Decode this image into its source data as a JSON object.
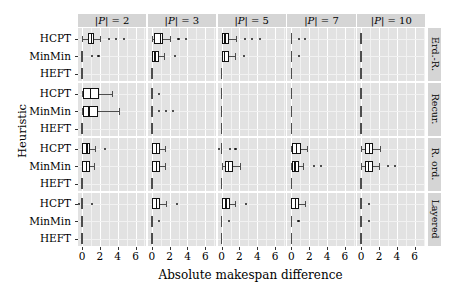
{
  "figure": {
    "x_axis_label": "Absolute makespan difference",
    "y_axis_label": "Heuristic",
    "x_ticks": [
      "0",
      "2",
      "4",
      "6"
    ],
    "x_tick_values": [
      0,
      2,
      4,
      6
    ],
    "x_range": [
      -0.45,
      7.2
    ],
    "heuristics": [
      "HCPT",
      "MinMin",
      "HEFT"
    ],
    "column_strips": [
      "|P| = 2",
      "|P| = 3",
      "|P| = 5",
      "|P| = 7",
      "|P| = 10"
    ],
    "row_strips": [
      "Erd.-R.",
      "Recur.",
      "R. ord.",
      "Layered"
    ],
    "colors": {
      "panel_background": "#e2e2e2",
      "strip_background": "#d5d5d5",
      "major_gridline": "#ffffff",
      "minor_gridline": "#f2f2f2",
      "box_outline": "#111111",
      "box_fill": "#ffffff",
      "whisker": "#4d4d4d",
      "outlier": "#1a1a1a"
    }
  },
  "chart_data": {
    "type": "box",
    "title": "",
    "xlabel": "Absolute makespan difference",
    "ylabel": "Heuristic",
    "xlim": [
      -0.45,
      7.2
    ],
    "x_ticks": [
      0,
      2,
      4,
      6
    ],
    "grid": true,
    "legend": "none",
    "facet_cols": [
      "|P| = 2",
      "|P| = 3",
      "|P| = 5",
      "|P| = 7",
      "|P| = 10"
    ],
    "facet_rows": [
      "Erd.-R.",
      "Recur.",
      "R. ord.",
      "Layered"
    ],
    "y_categories": [
      "HCPT",
      "MinMin",
      "HEFT"
    ],
    "panels": [
      {
        "row": "Erd.-R.",
        "col": "|P| = 2",
        "boxes": [
          {
            "heuristic": "HCPT",
            "whisker_low": 0.0,
            "q1": 0.72,
            "median": 1.05,
            "q3": 1.35,
            "whisker_high": 2.0,
            "outliers": [
              3.0,
              3.85,
              4.7
            ]
          },
          {
            "heuristic": "MinMin",
            "whisker_low": 0.0,
            "q1": 0.0,
            "median": 0.0,
            "q3": 0.0,
            "whisker_high": 0.0,
            "outliers": [
              1.1,
              1.85
            ]
          },
          {
            "heuristic": "HEFT",
            "whisker_low": 0.0,
            "q1": 0.0,
            "median": 0.0,
            "q3": 0.0,
            "whisker_high": 0.0,
            "outliers": []
          }
        ]
      },
      {
        "row": "Erd.-R.",
        "col": "|P| = 3",
        "boxes": [
          {
            "heuristic": "HCPT",
            "whisker_low": 0.0,
            "q1": 0.25,
            "median": 0.95,
            "q3": 1.3,
            "whisker_high": 2.0,
            "outliers": [
              3.0,
              3.8
            ]
          },
          {
            "heuristic": "MinMin",
            "whisker_low": 0.0,
            "q1": 0.0,
            "median": 0.35,
            "q3": 0.8,
            "whisker_high": 1.4,
            "outliers": [
              2.6
            ]
          },
          {
            "heuristic": "HEFT",
            "whisker_low": 0.0,
            "q1": 0.0,
            "median": 0.0,
            "q3": 0.0,
            "whisker_high": 0.0,
            "outliers": []
          }
        ]
      },
      {
        "row": "Erd.-R.",
        "col": "|P| = 5",
        "boxes": [
          {
            "heuristic": "HCPT",
            "whisker_low": 0.0,
            "q1": 0.0,
            "median": 0.4,
            "q3": 0.85,
            "whisker_high": 1.6,
            "outliers": [
              2.6,
              3.4,
              4.3
            ]
          },
          {
            "heuristic": "MinMin",
            "whisker_low": 0.0,
            "q1": 0.0,
            "median": 0.35,
            "q3": 0.8,
            "whisker_high": 1.45,
            "outliers": [
              2.5
            ]
          },
          {
            "heuristic": "HEFT",
            "whisker_low": 0.0,
            "q1": 0.0,
            "median": 0.0,
            "q3": 0.0,
            "whisker_high": 0.0,
            "outliers": []
          }
        ]
      },
      {
        "row": "Erd.-R.",
        "col": "|P| = 7",
        "boxes": [
          {
            "heuristic": "HCPT",
            "whisker_low": 0.0,
            "q1": 0.0,
            "median": 0.0,
            "q3": 0.0,
            "whisker_high": 0.0,
            "outliers": [
              0.85,
              1.55
            ]
          },
          {
            "heuristic": "MinMin",
            "whisker_low": 0.0,
            "q1": 0.0,
            "median": 0.0,
            "q3": 0.0,
            "whisker_high": 0.0,
            "outliers": [
              0.85
            ]
          },
          {
            "heuristic": "HEFT",
            "whisker_low": 0.0,
            "q1": 0.0,
            "median": 0.0,
            "q3": 0.0,
            "whisker_high": 0.0,
            "outliers": []
          }
        ]
      },
      {
        "row": "Erd.-R.",
        "col": "|P| = 10",
        "boxes": [
          {
            "heuristic": "HCPT",
            "whisker_low": 0.0,
            "q1": 0.0,
            "median": 0.0,
            "q3": 0.0,
            "whisker_high": 0.0,
            "outliers": []
          },
          {
            "heuristic": "MinMin",
            "whisker_low": 0.0,
            "q1": 0.0,
            "median": 0.0,
            "q3": 0.0,
            "whisker_high": 0.0,
            "outliers": []
          },
          {
            "heuristic": "HEFT",
            "whisker_low": 0.0,
            "q1": 0.0,
            "median": 0.0,
            "q3": 0.0,
            "whisker_high": 0.0,
            "outliers": []
          }
        ]
      },
      {
        "row": "Recur.",
        "col": "|P| = 2",
        "boxes": [
          {
            "heuristic": "HCPT",
            "whisker_low": 0.0,
            "q1": 0.1,
            "median": 0.95,
            "q3": 1.95,
            "whisker_high": 3.4,
            "outliers": []
          },
          {
            "heuristic": "MinMin",
            "whisker_low": 0.0,
            "q1": 0.1,
            "median": 0.8,
            "q3": 1.85,
            "whisker_high": 4.1,
            "outliers": []
          },
          {
            "heuristic": "HEFT",
            "whisker_low": 0.0,
            "q1": 0.0,
            "median": 0.0,
            "q3": 0.0,
            "whisker_high": 0.0,
            "outliers": []
          }
        ]
      },
      {
        "row": "Recur.",
        "col": "|P| = 3",
        "boxes": [
          {
            "heuristic": "HCPT",
            "whisker_low": 0.0,
            "q1": 0.0,
            "median": 0.0,
            "q3": 0.0,
            "whisker_high": 0.0,
            "outliers": [
              0.85
            ]
          },
          {
            "heuristic": "MinMin",
            "whisker_low": 0.0,
            "q1": 0.0,
            "median": 0.0,
            "q3": 0.0,
            "whisker_high": 0.0,
            "outliers": [
              0.85,
              1.6,
              2.35
            ]
          },
          {
            "heuristic": "HEFT",
            "whisker_low": 0.0,
            "q1": 0.0,
            "median": 0.0,
            "q3": 0.0,
            "whisker_high": 0.0,
            "outliers": []
          }
        ]
      },
      {
        "row": "Recur.",
        "col": "|P| = 5",
        "boxes": [
          {
            "heuristic": "HCPT",
            "whisker_low": 0.0,
            "q1": 0.0,
            "median": 0.0,
            "q3": 0.0,
            "whisker_high": 0.0,
            "outliers": []
          },
          {
            "heuristic": "MinMin",
            "whisker_low": 0.0,
            "q1": 0.0,
            "median": 0.0,
            "q3": 0.0,
            "whisker_high": 0.0,
            "outliers": []
          },
          {
            "heuristic": "HEFT",
            "whisker_low": 0.0,
            "q1": 0.0,
            "median": 0.0,
            "q3": 0.0,
            "whisker_high": 0.0,
            "outliers": []
          }
        ]
      },
      {
        "row": "Recur.",
        "col": "|P| = 7",
        "boxes": [
          {
            "heuristic": "HCPT",
            "whisker_low": 0.0,
            "q1": 0.0,
            "median": 0.0,
            "q3": 0.0,
            "whisker_high": 0.0,
            "outliers": []
          },
          {
            "heuristic": "MinMin",
            "whisker_low": 0.0,
            "q1": 0.0,
            "median": 0.0,
            "q3": 0.0,
            "whisker_high": 0.0,
            "outliers": []
          },
          {
            "heuristic": "HEFT",
            "whisker_low": 0.0,
            "q1": 0.0,
            "median": 0.0,
            "q3": 0.0,
            "whisker_high": 0.0,
            "outliers": []
          }
        ]
      },
      {
        "row": "Recur.",
        "col": "|P| = 10",
        "boxes": [
          {
            "heuristic": "HCPT",
            "whisker_low": 0.0,
            "q1": 0.0,
            "median": 0.0,
            "q3": 0.0,
            "whisker_high": 0.0,
            "outliers": []
          },
          {
            "heuristic": "MinMin",
            "whisker_low": 0.0,
            "q1": 0.0,
            "median": 0.0,
            "q3": 0.0,
            "whisker_high": 0.0,
            "outliers": []
          },
          {
            "heuristic": "HEFT",
            "whisker_low": 0.0,
            "q1": 0.0,
            "median": 0.0,
            "q3": 0.0,
            "whisker_high": 0.0,
            "outliers": []
          }
        ]
      },
      {
        "row": "R. ord.",
        "col": "|P| = 2",
        "boxes": [
          {
            "heuristic": "HCPT",
            "whisker_low": 0.0,
            "q1": 0.05,
            "median": 0.55,
            "q3": 0.95,
            "whisker_high": 1.45,
            "outliers": [
              2.6
            ]
          },
          {
            "heuristic": "MinMin",
            "whisker_low": 0.0,
            "q1": 0.05,
            "median": 0.5,
            "q3": 0.9,
            "whisker_high": 1.4,
            "outliers": []
          },
          {
            "heuristic": "HEFT",
            "whisker_low": 0.0,
            "q1": 0.0,
            "median": 0.0,
            "q3": 0.0,
            "whisker_high": 0.0,
            "outliers": []
          }
        ]
      },
      {
        "row": "R. ord.",
        "col": "|P| = 3",
        "boxes": [
          {
            "heuristic": "HCPT",
            "whisker_low": 0.0,
            "q1": 0.0,
            "median": 0.5,
            "q3": 0.95,
            "whisker_high": 1.5,
            "outliers": []
          },
          {
            "heuristic": "MinMin",
            "whisker_low": 0.0,
            "q1": 0.0,
            "median": 0.5,
            "q3": 0.95,
            "whisker_high": 1.5,
            "outliers": []
          },
          {
            "heuristic": "HEFT",
            "whisker_low": 0.0,
            "q1": 0.0,
            "median": 0.0,
            "q3": 0.0,
            "whisker_high": 0.0,
            "outliers": []
          }
        ]
      },
      {
        "row": "R. ord.",
        "col": "|P| = 5",
        "boxes": [
          {
            "heuristic": "HCPT",
            "whisker_low": 0.0,
            "q1": 0.0,
            "median": 0.0,
            "q3": 0.0,
            "whisker_high": 0.0,
            "outliers": [
              -0.25,
              0.9,
              1.55
            ]
          },
          {
            "heuristic": "MinMin",
            "whisker_low": 0.0,
            "q1": 0.35,
            "median": 0.8,
            "q3": 1.25,
            "whisker_high": 2.1,
            "outliers": []
          },
          {
            "heuristic": "HEFT",
            "whisker_low": 0.0,
            "q1": 0.0,
            "median": 0.0,
            "q3": 0.0,
            "whisker_high": 0.0,
            "outliers": []
          }
        ]
      },
      {
        "row": "R. ord.",
        "col": "|P| = 7",
        "boxes": [
          {
            "heuristic": "HCPT",
            "whisker_low": 0.0,
            "q1": 0.1,
            "median": 0.6,
            "q3": 1.05,
            "whisker_high": 1.75,
            "outliers": []
          },
          {
            "heuristic": "MinMin",
            "whisker_low": 0.0,
            "q1": 0.05,
            "median": 0.4,
            "q3": 0.8,
            "whisker_high": 1.35,
            "outliers": [
              2.55,
              3.3
            ]
          },
          {
            "heuristic": "HEFT",
            "whisker_low": 0.0,
            "q1": 0.0,
            "median": 0.0,
            "q3": 0.0,
            "whisker_high": 0.0,
            "outliers": []
          }
        ]
      },
      {
        "row": "R. ord.",
        "col": "|P| = 10",
        "boxes": [
          {
            "heuristic": "HCPT",
            "whisker_low": 0.0,
            "q1": 0.45,
            "median": 0.9,
            "q3": 1.35,
            "whisker_high": 2.1,
            "outliers": []
          },
          {
            "heuristic": "MinMin",
            "whisker_low": 0.0,
            "q1": 0.45,
            "median": 0.85,
            "q3": 1.3,
            "whisker_high": 2.0,
            "outliers": [
              3.0,
              3.75
            ]
          },
          {
            "heuristic": "HEFT",
            "whisker_low": 0.0,
            "q1": 0.0,
            "median": 0.0,
            "q3": 0.0,
            "whisker_high": 0.0,
            "outliers": []
          }
        ]
      },
      {
        "row": "Layered",
        "col": "|P| = 2",
        "boxes": [
          {
            "heuristic": "HCPT",
            "whisker_low": 0.0,
            "q1": 0.0,
            "median": 0.0,
            "q3": 0.0,
            "whisker_high": 0.0,
            "outliers": [
              -0.3,
              1.1
            ]
          },
          {
            "heuristic": "MinMin",
            "whisker_low": 0.0,
            "q1": 0.0,
            "median": 0.0,
            "q3": 0.0,
            "whisker_high": 0.0,
            "outliers": []
          },
          {
            "heuristic": "HEFT",
            "whisker_low": 0.0,
            "q1": 0.0,
            "median": 0.0,
            "q3": 0.0,
            "whisker_high": 0.0,
            "outliers": []
          }
        ]
      },
      {
        "row": "Layered",
        "col": "|P| = 3",
        "boxes": [
          {
            "heuristic": "HCPT",
            "whisker_low": 0.0,
            "q1": 0.0,
            "median": 0.5,
            "q3": 0.95,
            "whisker_high": 1.6,
            "outliers": [
              2.8
            ]
          },
          {
            "heuristic": "MinMin",
            "whisker_low": 0.0,
            "q1": 0.0,
            "median": 0.0,
            "q3": 0.0,
            "whisker_high": 0.0,
            "outliers": [
              0.85
            ]
          },
          {
            "heuristic": "HEFT",
            "whisker_low": 0.0,
            "q1": 0.0,
            "median": 0.0,
            "q3": 0.0,
            "whisker_high": 0.0,
            "outliers": []
          }
        ]
      },
      {
        "row": "Layered",
        "col": "|P| = 5",
        "boxes": [
          {
            "heuristic": "HCPT",
            "whisker_low": 0.0,
            "q1": 0.0,
            "median": 0.5,
            "q3": 0.95,
            "whisker_high": 1.55,
            "outliers": [
              2.7
            ]
          },
          {
            "heuristic": "MinMin",
            "whisker_low": 0.0,
            "q1": 0.0,
            "median": 0.0,
            "q3": 0.0,
            "whisker_high": 0.0,
            "outliers": [
              0.85
            ]
          },
          {
            "heuristic": "HEFT",
            "whisker_low": 0.0,
            "q1": 0.0,
            "median": 0.0,
            "q3": 0.0,
            "whisker_high": 0.0,
            "outliers": []
          }
        ]
      },
      {
        "row": "Layered",
        "col": "|P| = 7",
        "boxes": [
          {
            "heuristic": "HCPT",
            "whisker_low": 0.0,
            "q1": 0.0,
            "median": 0.45,
            "q3": 0.9,
            "whisker_high": 1.5,
            "outliers": []
          },
          {
            "heuristic": "MinMin",
            "whisker_low": 0.0,
            "q1": 0.0,
            "median": 0.0,
            "q3": 0.0,
            "whisker_high": 0.0,
            "outliers": [
              0.8
            ]
          },
          {
            "heuristic": "HEFT",
            "whisker_low": 0.0,
            "q1": 0.0,
            "median": 0.0,
            "q3": 0.0,
            "whisker_high": 0.0,
            "outliers": []
          }
        ]
      },
      {
        "row": "Layered",
        "col": "|P| = 10",
        "boxes": [
          {
            "heuristic": "HCPT",
            "whisker_low": 0.0,
            "q1": 0.0,
            "median": 0.0,
            "q3": 0.0,
            "whisker_high": 0.0,
            "outliers": [
              0.85
            ]
          },
          {
            "heuristic": "MinMin",
            "whisker_low": 0.0,
            "q1": 0.0,
            "median": 0.0,
            "q3": 0.0,
            "whisker_high": 0.0,
            "outliers": [
              0.85
            ]
          },
          {
            "heuristic": "HEFT",
            "whisker_low": 0.0,
            "q1": 0.0,
            "median": 0.0,
            "q3": 0.0,
            "whisker_high": 0.0,
            "outliers": []
          }
        ]
      }
    ]
  }
}
